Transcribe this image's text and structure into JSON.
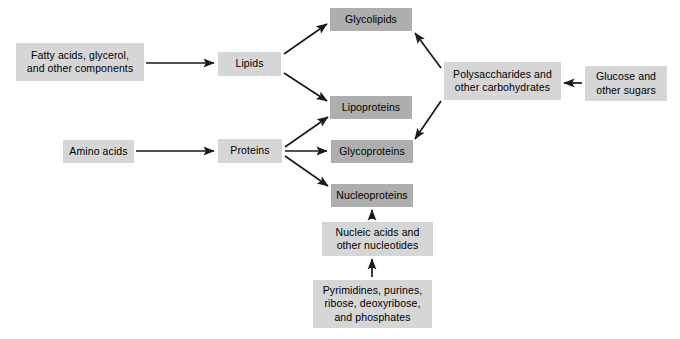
{
  "diagram": {
    "background_color": "#ffffff",
    "text_color": "#000000",
    "arrow_color": "#1a1a1a",
    "colors": {
      "box_light": "#d6d6d6",
      "box_dark": "#aeaeae"
    },
    "nodes": [
      {
        "id": "fatty-acids",
        "label": "Fatty acids, glycerol,\nand other components",
        "shade": "light",
        "x": 16,
        "y": 43,
        "w": 128,
        "h": 38
      },
      {
        "id": "lipids",
        "label": "Lipids",
        "shade": "light",
        "x": 218,
        "y": 52,
        "w": 63,
        "h": 24
      },
      {
        "id": "glycolipids",
        "label": "Glycolipids",
        "shade": "dark",
        "x": 330,
        "y": 8,
        "w": 82,
        "h": 23
      },
      {
        "id": "lipoproteins",
        "label": "Lipoproteins",
        "shade": "dark",
        "x": 330,
        "y": 96,
        "w": 82,
        "h": 23
      },
      {
        "id": "amino-acids",
        "label": "Amino acids",
        "shade": "light",
        "x": 63,
        "y": 140,
        "w": 71,
        "h": 23
      },
      {
        "id": "proteins",
        "label": "Proteins",
        "shade": "light",
        "x": 218,
        "y": 139,
        "w": 64,
        "h": 24
      },
      {
        "id": "glycoproteins",
        "label": "Glycoproteins",
        "shade": "dark",
        "x": 331,
        "y": 140,
        "w": 82,
        "h": 23
      },
      {
        "id": "nucleoproteins",
        "label": "Nucleoproteins",
        "shade": "dark",
        "x": 331,
        "y": 184,
        "w": 82,
        "h": 23
      },
      {
        "id": "polysaccharides",
        "label": "Polysaccharides and\nother carbohydrates",
        "shade": "light",
        "x": 444,
        "y": 62,
        "w": 117,
        "h": 38
      },
      {
        "id": "glucose",
        "label": "Glucose and\nother sugars",
        "shade": "light",
        "x": 585,
        "y": 66,
        "w": 82,
        "h": 35
      },
      {
        "id": "nucleic-acids",
        "label": "Nucleic acids and\nother nucleotides",
        "shade": "light",
        "x": 322,
        "y": 222,
        "w": 111,
        "h": 34
      },
      {
        "id": "precursors",
        "label": "Pyrimidines, purines,\nribose, deoxyribose,\nand phosphates",
        "shade": "light",
        "x": 313,
        "y": 280,
        "w": 119,
        "h": 48
      }
    ],
    "edges": [
      {
        "id": "fatty-acids-to-lipids",
        "from": "fatty-acids",
        "to": "lipids",
        "x1": 146,
        "y1": 63,
        "x2": 214,
        "y2": 63
      },
      {
        "id": "lipids-to-glycolipids",
        "from": "lipids",
        "to": "glycolipids",
        "x1": 284,
        "y1": 54,
        "x2": 327,
        "y2": 24
      },
      {
        "id": "lipids-to-lipoproteins",
        "from": "lipids",
        "to": "lipoproteins",
        "x1": 284,
        "y1": 73,
        "x2": 327,
        "y2": 101
      },
      {
        "id": "amino-acids-to-proteins",
        "from": "amino-acids",
        "to": "proteins",
        "x1": 136,
        "y1": 151,
        "x2": 214,
        "y2": 151
      },
      {
        "id": "proteins-to-lipoproteins",
        "from": "proteins",
        "to": "lipoproteins",
        "x1": 285,
        "y1": 147,
        "x2": 328,
        "y2": 117
      },
      {
        "id": "proteins-to-glycoproteins",
        "from": "proteins",
        "to": "glycoproteins",
        "x1": 285,
        "y1": 151,
        "x2": 327,
        "y2": 151
      },
      {
        "id": "proteins-to-nucleoproteins",
        "from": "proteins",
        "to": "nucleoproteins",
        "x1": 285,
        "y1": 156,
        "x2": 328,
        "y2": 186
      },
      {
        "id": "polysaccharides-to-glycolipids",
        "from": "polysaccharides",
        "to": "glycolipids",
        "x1": 441,
        "y1": 68,
        "x2": 415,
        "y2": 33
      },
      {
        "id": "polysaccharides-to-glycoproteins",
        "from": "polysaccharides",
        "to": "glycoproteins",
        "x1": 441,
        "y1": 101,
        "x2": 415,
        "y2": 139
      },
      {
        "id": "glucose-to-polysaccharides",
        "from": "glucose",
        "to": "polysaccharides",
        "x1": 582,
        "y1": 83,
        "x2": 564,
        "y2": 83
      },
      {
        "id": "precursors-to-nucleic-acids",
        "from": "precursors",
        "to": "nucleic-acids",
        "x1": 372,
        "y1": 277,
        "x2": 372,
        "y2": 259
      },
      {
        "id": "nucleic-acids-to-nucleoproteins",
        "from": "nucleic-acids",
        "to": "nucleoproteins",
        "x1": 372,
        "y1": 219,
        "x2": 372,
        "y2": 210
      }
    ]
  }
}
